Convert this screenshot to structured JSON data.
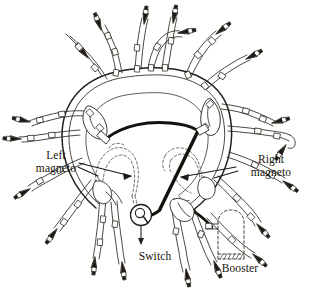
{
  "figure": {
    "background_color": "#ffffff",
    "ink_color": "#17140f",
    "line_color": "#3a332b",
    "cable_color": "#1a1713"
  },
  "labels": {
    "left_magneto": "Left\nmagneto",
    "right_magneto": "Right\nmagneto",
    "switch": "Switch",
    "booster": "Booster"
  },
  "components": {
    "engine_ring": "engine-crankcase-ring",
    "left_magneto_outline": "dashed-hidden-outline",
    "right_magneto_outline": "dashed-hidden-outline",
    "booster_outline": "dashed-optional-component",
    "switch_body": "rotary-ignition-switch",
    "spark_plug_leads_count": 18,
    "harness_collars_visible": true
  },
  "legend": {
    "solid_thin": "ignition harness lead",
    "solid_thick": "primary magneto cable",
    "dashed": "component hidden behind engine"
  }
}
